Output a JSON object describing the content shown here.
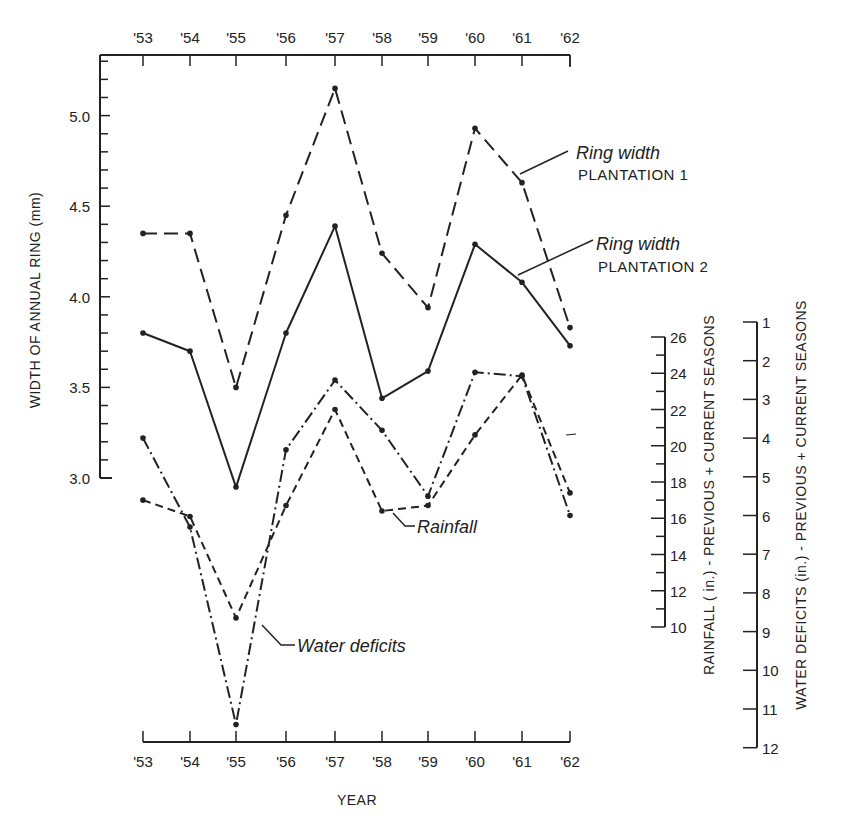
{
  "chart_data": {
    "type": "line",
    "title": "",
    "x": [
      "'53",
      "'54",
      "'55",
      "'56",
      "'57",
      "'58",
      "'59",
      "'60",
      "'61",
      "'62"
    ],
    "xlabel": "YEAR",
    "ylabel": "WIDTH OF ANNUAL RING (mm)",
    "ylim": [
      2.9,
      5.3
    ],
    "yticks": [
      "3.0",
      "3.5",
      "4.0",
      "4.5",
      "5.0"
    ],
    "grid": false,
    "secondary_axes": [
      {
        "id": "rainfall",
        "label": "RAINFALL ( in.) - PREVIOUS + CURRENT SEASONS",
        "ticks": [
          "26",
          "24",
          "22",
          "20",
          "18",
          "16",
          "14",
          "12",
          "10"
        ],
        "range": [
          10,
          26
        ]
      },
      {
        "id": "water_deficits",
        "label": "WATER DEFICITS (in.) - PREVIOUS + CURRENT SEASONS",
        "ticks": [
          "1",
          "2",
          "3",
          "4",
          "5",
          "6",
          "7",
          "8",
          "9",
          "10",
          "11",
          "12"
        ],
        "range": [
          1,
          12
        ],
        "inverted": true
      }
    ],
    "series": [
      {
        "name": "Ring width PLANTATION 1",
        "label_line1": "Ring width",
        "label_line2": "PLANTATION 1",
        "axis": "left",
        "style": "long-dash",
        "values": [
          4.35,
          4.35,
          3.5,
          4.45,
          5.15,
          4.24,
          3.94,
          4.93,
          4.63,
          3.83
        ]
      },
      {
        "name": "Ring width PLANTATION 2",
        "label_line1": "Ring width",
        "label_line2": "PLANTATION 2",
        "axis": "left",
        "style": "solid",
        "values": [
          3.8,
          3.7,
          2.95,
          3.8,
          4.39,
          3.44,
          3.59,
          4.29,
          4.08,
          3.73
        ]
      },
      {
        "name": "Rainfall",
        "label_line1": "Rainfall",
        "axis": "rainfall",
        "style": "short-dash",
        "values": [
          17.0,
          16.1,
          10.5,
          16.7,
          22.0,
          16.4,
          16.7,
          20.6,
          23.9,
          17.4
        ]
      },
      {
        "name": "Water deficits",
        "label_line1": "Water deficits",
        "axis": "water_deficits",
        "style": "dash-dot",
        "values": [
          4.0,
          6.3,
          11.4,
          4.3,
          2.5,
          3.8,
          5.5,
          2.3,
          2.4,
          6.0
        ]
      }
    ]
  },
  "colors": {
    "ink": "#222222",
    "background": "#ffffff"
  }
}
